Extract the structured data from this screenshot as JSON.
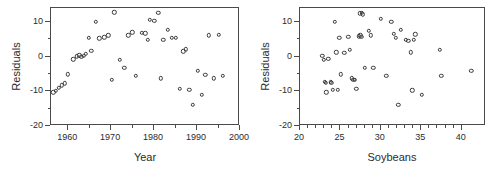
{
  "figure": {
    "background": "#ffffff",
    "marker_color": "#3a3a3a",
    "axis_color": "#4a4a4a",
    "panel_count": 2
  },
  "chart_data": [
    {
      "type": "scatter",
      "panel": "left",
      "title": "",
      "xlabel": "Year",
      "ylabel": "Residuals",
      "xlim": [
        1956,
        2000
      ],
      "ylim": [
        -20,
        14
      ],
      "xticks": [
        1960,
        1970,
        1980,
        1990,
        2000
      ],
      "yticks": [
        10,
        0,
        -10,
        -20
      ],
      "xtick_labels": [
        "1960",
        "1970",
        "1980",
        "1990",
        "2000"
      ],
      "ytick_labels": [
        "10",
        "0",
        "-10",
        "-20"
      ],
      "minor_ticks": true,
      "grid": false,
      "legend": null,
      "x": [
        1956.8,
        1957.4,
        1958.1,
        1958.8,
        1959.5,
        1960.2,
        1961.4,
        1962.2,
        1962.8,
        1963.3,
        1963.9,
        1964.4,
        1965.0,
        1965.6,
        1966.6,
        1967.5,
        1968.6,
        1969.6,
        1970.4,
        1971.0,
        1972.2,
        1973.3,
        1974.2,
        1975.2,
        1976.0,
        1977.4,
        1978.2,
        1978.7,
        1979.3,
        1980.3,
        1981.2,
        1981.8,
        1982.4,
        1983.4,
        1984.4,
        1985.3,
        1986.2,
        1987.0,
        1987.6,
        1988.4,
        1989.3,
        1990.4,
        1991.3,
        1992.2,
        1993.0,
        1994.2,
        1995.3,
        1996.2
      ],
      "y": [
        -10.6,
        -10.1,
        -9.3,
        -8.6,
        -8.0,
        -5.4,
        -1.1,
        -0.2,
        0.1,
        -0.3,
        0.0,
        0.6,
        5.1,
        1.4,
        9.7,
        5.0,
        5.3,
        5.8,
        -7.0,
        12.5,
        -1.3,
        -3.6,
        5.8,
        6.7,
        -5.9,
        6.6,
        6.4,
        4.5,
        10.3,
        10.0,
        12.3,
        -6.5,
        4.6,
        7.4,
        5.2,
        5.1,
        -9.5,
        1.2,
        1.8,
        -9.9,
        -14.2,
        -4.4,
        -11.3,
        -5.5,
        5.8,
        -6.5,
        6.0,
        -5.8
      ]
    },
    {
      "type": "scatter",
      "panel": "right",
      "title": "",
      "xlabel": "Soybeans",
      "ylabel": "Residuals",
      "xlim": [
        20,
        43
      ],
      "ylim": [
        -20,
        14
      ],
      "xticks": [
        20,
        25,
        30,
        35,
        40
      ],
      "yticks": [
        10,
        0,
        -10,
        -20
      ],
      "xtick_labels": [
        "20",
        "25",
        "30",
        "35",
        "40"
      ],
      "ytick_labels": [
        "10",
        "0",
        "-10",
        "-20"
      ],
      "minor_ticks": true,
      "grid": false,
      "legend": null,
      "x": [
        22.9,
        23.1,
        23.2,
        23.3,
        23.4,
        23.6,
        23.9,
        24.0,
        24.2,
        24.4,
        24.6,
        24.8,
        25.0,
        25.2,
        25.6,
        26.1,
        26.3,
        26.5,
        26.7,
        26.9,
        27.1,
        27.4,
        27.6,
        27.7,
        27.8,
        27.9,
        28.1,
        28.6,
        28.9,
        29.2,
        30.1,
        30.8,
        31.4,
        31.7,
        32.0,
        32.3,
        32.6,
        33.2,
        33.5,
        33.8,
        34.0,
        34.2,
        34.4,
        35.2,
        37.4,
        37.6,
        41.3,
        27.5
      ],
      "y": [
        0.0,
        -1.2,
        -7.5,
        -7.9,
        -10.6,
        -0.9,
        -7.6,
        -7.8,
        -9.8,
        9.7,
        0.9,
        -9.9,
        5.2,
        -5.4,
        0.8,
        5.4,
        1.6,
        -6.6,
        -7.0,
        -6.9,
        -9.5,
        5.6,
        5.9,
        5.5,
        12.4,
        11.9,
        -3.6,
        7.1,
        5.8,
        -3.5,
        10.6,
        -5.9,
        9.8,
        6.3,
        5.1,
        -14.2,
        7.4,
        4.6,
        4.3,
        1.0,
        -10.0,
        4.5,
        6.1,
        -11.3,
        1.7,
        -5.8,
        -4.3,
        12.2
      ]
    }
  ]
}
